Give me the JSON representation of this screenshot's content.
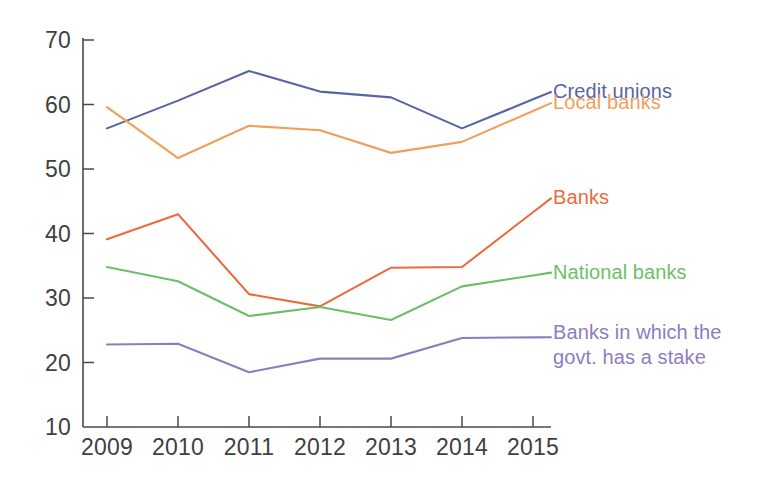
{
  "chart_data": {
    "type": "line",
    "title": "",
    "subtitle": "",
    "xlabel": "",
    "ylabel": "",
    "categories": [
      "2009",
      "2010",
      "2011",
      "2012",
      "2013",
      "2014",
      "2015"
    ],
    "x": [
      2009,
      2010,
      2011,
      2012,
      2013,
      2014,
      2015
    ],
    "xlim": [
      2009,
      2015
    ],
    "ylim": [
      10,
      70
    ],
    "yticks": [
      10,
      20,
      30,
      40,
      50,
      60,
      70
    ],
    "ytick_labels": [
      "10",
      "20",
      "30",
      "40",
      "50",
      "60",
      "70"
    ],
    "xtick_labels": [
      "2009",
      "2010",
      "2011",
      "2012",
      "2013",
      "2014",
      "2015"
    ],
    "grid": false,
    "legend_position": "right-inline-end-of-line",
    "series": [
      {
        "name": "Credit unions",
        "color": "#5a63a3",
        "values": [
          56.3,
          60.6,
          65.2,
          62.0,
          61.1,
          56.3,
          60.8
        ]
      },
      {
        "name": "Local banks",
        "color": "#f0a05a",
        "values": [
          59.6,
          51.7,
          56.7,
          56.0,
          52.5,
          54.2,
          59.0
        ]
      },
      {
        "name": "Banks",
        "color": "#ec6b3c",
        "values": [
          39.1,
          43.0,
          30.6,
          28.7,
          34.7,
          34.8,
          43.3
        ]
      },
      {
        "name": "National banks",
        "color": "#6dbf67",
        "values": [
          34.8,
          32.6,
          27.2,
          28.6,
          26.6,
          31.8,
          33.5
        ]
      },
      {
        "name": "Banks in which the govt. has a stake",
        "color": "#8d7dc0",
        "values": [
          22.8,
          22.9,
          18.5,
          20.6,
          20.6,
          23.8,
          23.9
        ]
      }
    ]
  },
  "legend": [
    {
      "label": "Credit unions",
      "color": "#5a63a3"
    },
    {
      "label": "Local banks",
      "color": "#f0a05a"
    },
    {
      "label": "Banks",
      "color": "#ec6b3c"
    },
    {
      "label": "National banks",
      "color": "#6dbf67"
    },
    {
      "label_line_1": "Banks in which the",
      "label_line_2": "govt. has a stake",
      "color": "#8d7dc0"
    }
  ],
  "colors": {
    "credit_unions": "#5a63a3",
    "local_banks": "#f0a05a",
    "banks": "#ec6b3c",
    "national_banks": "#6dbf67",
    "govt_stake_banks": "#8d7dc0",
    "axis": "#4a4a4a",
    "background": "#ffffff"
  }
}
